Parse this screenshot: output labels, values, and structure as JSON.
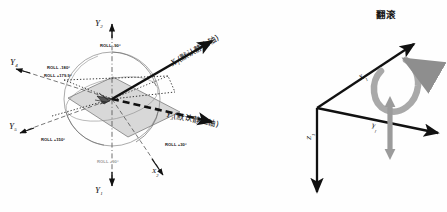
{
  "figure": {
    "panels": [
      {
        "id": "roll-reference-sphere",
        "axes": [
          {
            "name": "Y2-up",
            "label": "Y",
            "sub": "2"
          },
          {
            "name": "Y1-down",
            "label": "Y",
            "sub": "1"
          },
          {
            "name": "Y-left-upper",
            "label": "Y",
            "sub": "4"
          },
          {
            "name": "Y-left-lower",
            "label": "Y",
            "sub": "5"
          },
          {
            "name": "X1-axis",
            "label": "X",
            "sub": "1"
          },
          {
            "name": "Y3-axis",
            "label": "Y",
            "sub": "3"
          },
          {
            "name": "X-lower-right",
            "label": "X",
            "sub": "2"
          }
        ],
        "annotations": {
          "x1_axis_note": "(默认静止轴)",
          "y3_axis_note": "(默认静止轴)"
        },
        "roll_labels": [
          {
            "text": "ROLL -90°",
            "gray": false
          },
          {
            "text": "ROLL -180°",
            "gray": false
          },
          {
            "text": "ROLL +179.9°",
            "gray": false
          },
          {
            "text": "ROLL +150°",
            "gray": false
          },
          {
            "text": "ROLL +90°",
            "gray": true
          },
          {
            "text": "ROLL +30°",
            "gray": false
          }
        ]
      },
      {
        "id": "roll-motion-triad",
        "title": "翻滚",
        "axes": [
          {
            "name": "X1",
            "label": "X",
            "sub": "1"
          },
          {
            "name": "Y1",
            "label": "Y",
            "sub": "1"
          },
          {
            "name": "Z1",
            "label": "Z",
            "sub": "1"
          }
        ]
      }
    ],
    "colors": {
      "stroke": "#111111",
      "plane_fill": "#c9c9c9",
      "arc": "#6b6b6b",
      "gray_text": "#9a9a9a",
      "gray_arrow": "#8e8e8e",
      "background": "#fefefe"
    }
  }
}
